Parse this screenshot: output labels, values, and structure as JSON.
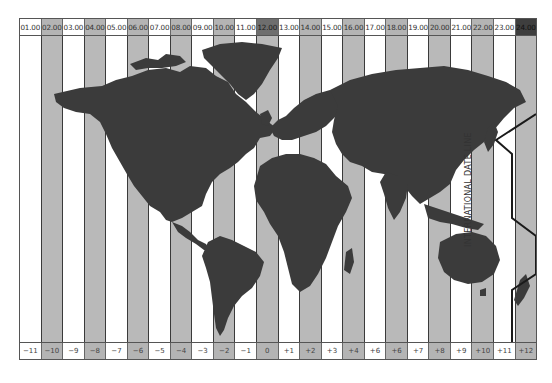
{
  "colors": {
    "land": "#3b3b3b",
    "band_light": "#ffffff",
    "band_gray": "#b9b9b9",
    "noon_header": "#6e6e6e",
    "midnight_header": "#3e3e3e",
    "date_line": "#1a1a1a"
  },
  "header": {
    "times": [
      "01.00",
      "02.00",
      "03.00",
      "04.00",
      "05.00",
      "06.00",
      "07.00",
      "08.00",
      "09.00",
      "10.00",
      "11.00",
      "12.00",
      "13.00",
      "14.00",
      "15.00",
      "16.00",
      "17.00",
      "18.00",
      "19.00",
      "20.00",
      "21.00",
      "22.00",
      "23.00",
      "24.00"
    ]
  },
  "footer": {
    "offsets": [
      "−11",
      "−10",
      "−9",
      "−8",
      "−7",
      "−6",
      "−5",
      "−4",
      "−3",
      "−2",
      "−1",
      "0",
      "+1",
      "+2",
      "+3",
      "+4",
      "+6",
      "+6",
      "+7",
      "+8",
      "+9",
      "+10",
      "+11",
      "+12"
    ]
  },
  "date_line": {
    "label": "INTERNATIONAL DATE LINE"
  }
}
